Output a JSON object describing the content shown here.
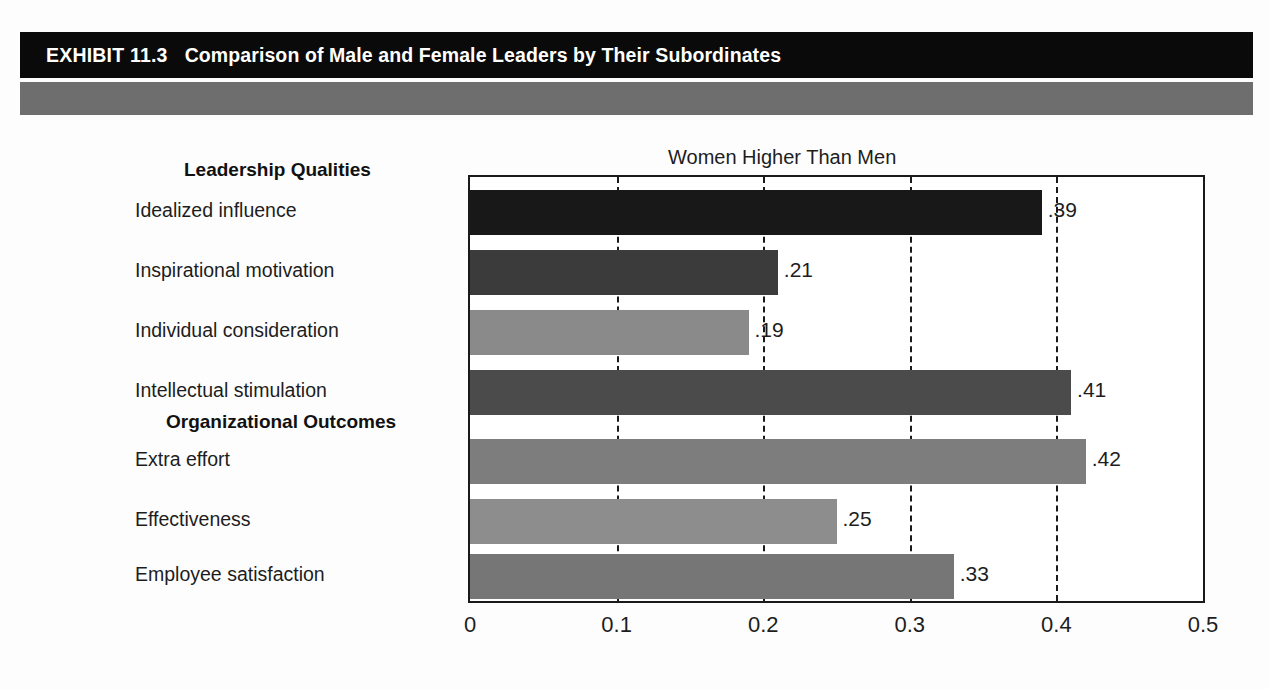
{
  "header": {
    "exhibit_label": "EXHIBIT 11.3",
    "exhibit_title": "Comparison of Male and Female Leaders by Their Subordinates",
    "bar_color": "#0a0a0a",
    "subbar_color": "#6e6e6e"
  },
  "chart_data": {
    "type": "bar",
    "orientation": "horizontal",
    "title": "Women Higher Than Men",
    "xlabel": "",
    "ylabel": "",
    "xlim": [
      0,
      0.5
    ],
    "xticks": [
      "0",
      "0.1",
      "0.2",
      "0.3",
      "0.4",
      "0.5"
    ],
    "xtick_values": [
      0,
      0.1,
      0.2,
      0.3,
      0.4,
      0.5
    ],
    "grid": "vertical-dashed",
    "legend": "none",
    "groups": [
      {
        "name": "Leadership Qualities",
        "first_index": 0
      },
      {
        "name": "Organizational Outcomes",
        "first_index": 4
      }
    ],
    "categories": [
      "Idealized influence",
      "Inspirational motivation",
      "Individual consideration",
      "Intellectual stimulation",
      "Extra effort",
      "Effectiveness",
      "Employee satisfaction"
    ],
    "values": [
      0.39,
      0.21,
      0.19,
      0.41,
      0.42,
      0.25,
      0.33
    ],
    "value_labels": [
      ".39",
      ".21",
      ".19",
      ".41",
      ".42",
      ".25",
      ".33"
    ],
    "bar_colors": [
      "#181818",
      "#3b3b3b",
      "#8a8a8a",
      "#4b4b4b",
      "#7d7d7d",
      "#8d8d8d",
      "#767676"
    ]
  }
}
